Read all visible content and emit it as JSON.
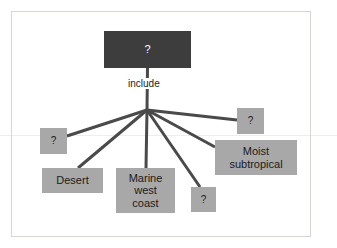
{
  "diagram": {
    "background_color": "#ffffff",
    "frame_border_color": "#d6d6d2",
    "root_fill": "#3d3d3d",
    "root_text_color": "#ffffff",
    "leaf_fill": "#a8a8a8",
    "leaf_text_color": "#1b1b1b",
    "connector_color": "#4a4a4a",
    "root": {
      "label": "?",
      "x": 104,
      "y": 31,
      "width": 87,
      "height": 37,
      "font_size": 11
    },
    "edge_label": {
      "label": "include",
      "x": 126,
      "y": 78,
      "font_size": 10
    },
    "hub": {
      "x": 147,
      "y": 110
    },
    "leaves": [
      {
        "id": "leaf-unknown-left",
        "label": "?",
        "x": 40,
        "y": 128,
        "width": 27,
        "height": 26,
        "font_size": 10,
        "anchor_x": 67,
        "anchor_y": 136
      },
      {
        "id": "leaf-desert",
        "label": "Desert",
        "x": 42,
        "y": 168,
        "width": 61,
        "height": 25,
        "font_size": 11,
        "anchor_x": 78,
        "anchor_y": 168
      },
      {
        "id": "leaf-marine-west-coast",
        "label": "Marine\nwest\ncoast",
        "x": 116,
        "y": 168,
        "width": 59,
        "height": 45,
        "font_size": 11,
        "anchor_x": 146,
        "anchor_y": 168
      },
      {
        "id": "leaf-unknown-bottom",
        "label": "?",
        "x": 191,
        "y": 187,
        "width": 25,
        "height": 25,
        "font_size": 10,
        "anchor_x": 200,
        "anchor_y": 187
      },
      {
        "id": "leaf-moist-subtropical",
        "label": "Moist\nsubtropical",
        "x": 215,
        "y": 140,
        "width": 82,
        "height": 35,
        "font_size": 11,
        "anchor_x": 215,
        "anchor_y": 147
      },
      {
        "id": "leaf-unknown-right",
        "label": "?",
        "x": 237,
        "y": 108,
        "width": 27,
        "height": 26,
        "font_size": 10,
        "anchor_x": 237,
        "anchor_y": 120
      }
    ]
  }
}
